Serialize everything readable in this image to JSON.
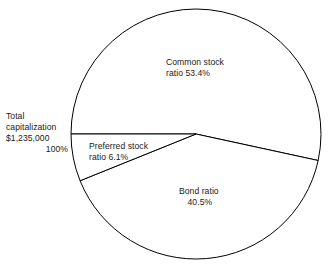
{
  "figure": {
    "background_color": "#ffffff",
    "line_color": "#000000",
    "text_color": "#1a1a1a",
    "cropped_title_fragment": ""
  },
  "total": {
    "line1": "Total",
    "line2": "capitalization",
    "line3": "$1,235,000",
    "percent": "100%"
  },
  "labels": {
    "common": {
      "line1": "Common stock",
      "line2": "ratio  53.4%"
    },
    "preferred": {
      "line1": "Preferred stock",
      "line2": "ratio 6.1%"
    },
    "bond": {
      "line1": "Bond ratio",
      "line2": "40.5%"
    }
  },
  "chart_data": {
    "type": "pie",
    "title": "",
    "subtitle": "",
    "xlabel": "",
    "ylabel": "",
    "grid": false,
    "legend": "none",
    "center": [
      196,
      134
    ],
    "radius": 125,
    "start_angle_deg": 180,
    "direction": "clockwise",
    "total_label": "Total capitalization $1,235,000",
    "total_value": "$1,235,000",
    "total_percent": "100%",
    "categories": [
      "Common stock ratio",
      "Bond ratio",
      "Preferred stock ratio"
    ],
    "values": [
      53.4,
      40.5,
      6.1
    ],
    "value_labels": [
      "53.4%",
      "40.5%",
      "6.1%"
    ],
    "slice_fill": "#ffffff",
    "slice_stroke": "#000000",
    "slices": [
      {
        "name": "Common stock ratio",
        "percent": 53.4,
        "label_line1": "Common stock",
        "label_line2": "ratio  53.4%",
        "sweep_deg": 192.24,
        "start_deg": 180,
        "end_deg": 12.24
      },
      {
        "name": "Bond ratio",
        "percent": 40.5,
        "label_line1": "Bond ratio",
        "label_line2": "40.5%",
        "sweep_deg": 145.8,
        "start_deg": 12.24,
        "end_deg": 158.04
      },
      {
        "name": "Preferred stock ratio",
        "percent": 6.1,
        "label_line1": "Preferred stock",
        "label_line2": "ratio 6.1%",
        "sweep_deg": 21.96,
        "start_deg": 158.04,
        "end_deg": 180
      }
    ]
  }
}
